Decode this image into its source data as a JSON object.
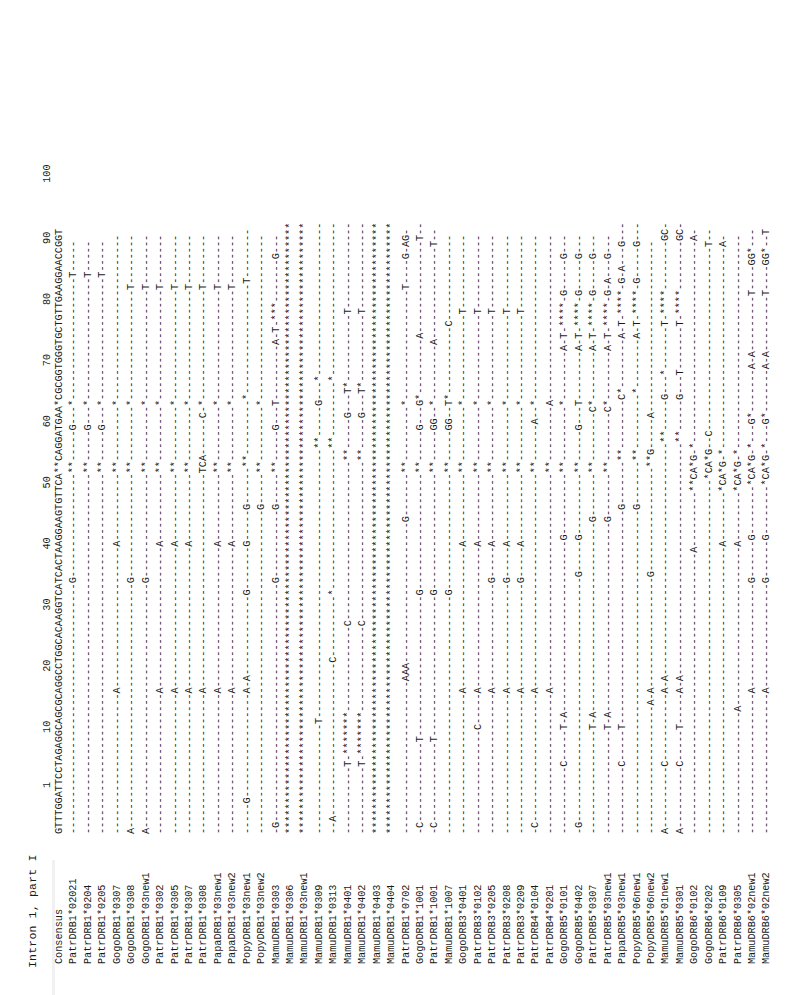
{
  "figure": {
    "title": "Intron 1, part I",
    "ruler": "1        10        20        30        40        50        60        70        80        90        100",
    "consensus": {
      "label": "Consensus",
      "sequence": "GTTTGGATTCCTAGAGGCAGCGCAGGCCTGGCACAAGGTCATCACTAAGGAAGTGTTCA**CAGGATGAA*CGCGGTGGGTGCTGTTGAAGGAACCGGT"
    },
    "rows": [
      {
        "label": "PatrDRB1*02021",
        "sequence": "-----------------------------------------G-----------------**-----G---*--------------------T-----"
      },
      {
        "label": "PatrDRB1*0204",
        "sequence": "-----------------------------------------------------------**-----G---*--------------------T-----"
      },
      {
        "label": "PatrDRB1*0205",
        "sequence": "-----------------------------------------------------------**-----G---*--------------------T-----"
      },
      {
        "label": "GogoDRB1*0307",
        "sequence": "-----------------------A-----------------------A-----------**---------*---------------------------"
      },
      {
        "label": "GogoDRB1*0308",
        "sequence": "A----------------------------------------G-----------------**---------*------------------T--------"
      },
      {
        "label": "GogoDRB1*03new1",
        "sequence": "A----------------------------------------G-----------------**---------*------------------T--------"
      },
      {
        "label": "PatrDRB1*0302",
        "sequence": "-----------------------A-----------------------A-----------**---------*------------------T--------"
      },
      {
        "label": "PatrDRB1*0305",
        "sequence": "-----------------------A-----------------------A-----------**---------*------------------T--------"
      },
      {
        "label": "PatrDRB1*0307",
        "sequence": "-----------------------A-----------------------A-----------**---------*------------------T--------"
      },
      {
        "label": "PatrDRB1*0308",
        "sequence": "-----------------------A-----------------------------------TCA------C-*------------------T--------"
      },
      {
        "label": "PapaDRB1*03new1",
        "sequence": "-----------------------A-----------------------A-----------**---------*------------------T--------"
      },
      {
        "label": "PapaDRB1*03new2",
        "sequence": "-----------------------A-----------------------A-----------**---------*------------------T--------"
      },
      {
        "label": "PopyDRB1*03new1",
        "sequence": "-----G-----------------A-A-------------G-------G-----G------**---------*------------------T--------"
      },
      {
        "label": "PopyDRB1*03new2",
        "sequence": "-----------------------------------------------------G-----**---------*---------------------------"
      },
      {
        "label": "MamuDRB1*0303",
        "sequence": "-G---------------------------------------G-----------G-----**-----G---T---------A-T-***-------G---"
      },
      {
        "label": "MamuDRB1*0306",
        "sequence": "****************************************************************************************************"
      },
      {
        "label": "MamuDRB1*03new1",
        "sequence": "****************************************************************************************************"
      },
      {
        "label": "MamuDRB1*0309",
        "sequence": "------------------T--------------------------------------------**-----G---*-------------------------"
      },
      {
        "label": "MamuDRB1*0313",
        "sequence": "--A-------------------------C----------*-----------------------**---------*-------------------------"
      },
      {
        "label": "MamuDRB1*0401",
        "sequence": "-----------T-*******--------------C--------------------------**-----G---T*-----------T--------------"
      },
      {
        "label": "MamuDRB1*0402",
        "sequence": "-----------T-*******--------------C--------------------------**-----G---T*-----------T--------------"
      },
      {
        "label": "MamuDRB1*0403",
        "sequence": "****************************************************************************************************"
      },
      {
        "label": "MamuDRB1*0404",
        "sequence": "****************************************************************************************************"
      },
      {
        "label": "PatrDRB1*0702",
        "sequence": "-------------------------AAA-----------------------G-------**---------*------------------T----G-AG-"
      },
      {
        "label": "GogoDRB1*1001",
        "sequence": "-C-------------T-----------------------G-------------------**-----G---G*---------A---------------T--"
      },
      {
        "label": "PatrDRB1*1001",
        "sequence": "-C-------------T-----------------------G-------------------**-----GG--*---------A---------------T--"
      },
      {
        "label": "MamuDRB1*1007",
        "sequence": "---------------------------------------G-------------------**-----GG--T*-----------C--------------"
      },
      {
        "label": "GogoDRB3*0401",
        "sequence": "-----------------------A-----------------------A-----------**---------*--------------T------------"
      },
      {
        "label": "PatrDRB3*0102",
        "sequence": "-----------------C-----A-----------------------A-----------**---------*--------------T------------"
      },
      {
        "label": "PatrDRB3*0205",
        "sequence": "-----------------------A-----------------G-----A-----------**---------*--------------T------------"
      },
      {
        "label": "PatrDRB3*0208",
        "sequence": "-----------------------A-----------------G-----A-----------**---------*--------------T------------"
      },
      {
        "label": "PatrDRB3*0209",
        "sequence": "-----------------------A-----------------G-----A-----------**---------*--------------T------------"
      },
      {
        "label": "PatrDRB4*0104",
        "sequence": "-C---------------------A-----------------------------------**------A--*---------------------------"
      },
      {
        "label": "PatrDRB4*0201",
        "sequence": "-----------------------A-----------------------------------**---------A---------------------------"
      },
      {
        "label": "GogoDRB5*0101",
        "sequence": "-----------C-----T-A----------------------------G----------**---------*--------A-T-****-G-----G---"
      },
      {
        "label": "GogoDRB5*0402",
        "sequence": "-G----------------------------------------G-----G----------**-----G---T--------A-T-****-G-----G---"
      },
      {
        "label": "PatrDRB5*0307",
        "sequence": "-----------------T-A-------------------------------G-------**--------C*--------A-T-****-G-----G---"
      },
      {
        "label": "PatrDRB5*03new1",
        "sequence": "-----------------T-A-------------------------------G-------**--------C*--------A-T-****-G-A---G---"
      },
      {
        "label": "PapaDRB5*03new1",
        "sequence": "-----------C-----T-----------------------------------G-------**--------C*--------A-T-****-G-A---G---"
      },
      {
        "label": "PopyDRB5*06new1",
        "sequence": "-----------------------------------------------------G-------**---------*--------A-T-****-G-----G---"
      },
      {
        "label": "PopyDRB5*06new2",
        "sequence": "---------------------A-A------------------G-----------------**G-----A----------------------------"
      },
      {
        "label": "MamuDRB5*01new1",
        "sequence": "A----------C-----------A-A--------------------------------------**-----G---*-------T-****--------GC-"
      },
      {
        "label": "MamuDRB5*0301",
        "sequence": "A----------C-----T-----A-A--------------------------------------**-----G---T-------T-****--------GC-"
      },
      {
        "label": "GogoDRB6*0102",
        "sequence": "----------------------------------------------A---------**CA*G-*---------------------------------A-"
      },
      {
        "label": "GogoDRB6*0202",
        "sequence": "----------------------------------------------------------*CA*G--C------------------------------T--"
      },
      {
        "label": "PatrDRB6*0109",
        "sequence": "-----------------------------------------------A--------*CA*G-*---------------------------------A-"
      },
      {
        "label": "PatrDRB6*0305",
        "sequence": "--------------------A--------------------------A--------*CA*G-*-----------------------------------"
      },
      {
        "label": "MamuDRB6*02new1",
        "sequence": "-----------------------A-----------------G------G--------*CA*G-*---G*-------A-A---------T----GG*---"
      },
      {
        "label": "MamuDRB6*02new2",
        "sequence": "-----------------------A-----------------G------G--------*CA*G-*---G*-------A-A---------T----GG*--T"
      }
    ]
  }
}
